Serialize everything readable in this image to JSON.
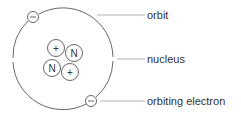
{
  "diagram": {
    "labels": {
      "orbit": "orbit",
      "nucleus": "nucleus",
      "electron": "orbiting electron"
    },
    "nucleus_particles": [
      {
        "symbol": "+",
        "type": "proton"
      },
      {
        "symbol": "N",
        "type": "neutron"
      },
      {
        "symbol": "N",
        "type": "neutron"
      },
      {
        "symbol": "+",
        "type": "proton"
      }
    ],
    "electrons": [
      {
        "symbol": "−"
      },
      {
        "symbol": "−"
      }
    ],
    "colors": {
      "stroke": "#555555",
      "text": "#333333",
      "leader": "#999999"
    }
  }
}
